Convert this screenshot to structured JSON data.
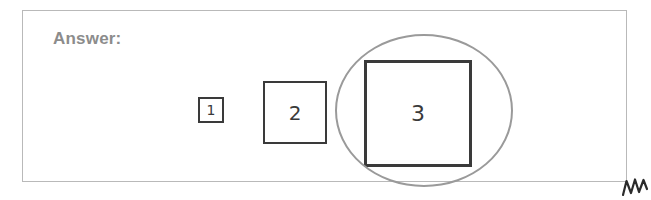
{
  "panel": {
    "label": "Answer:",
    "border_color": "#b9b9b9",
    "background": "#ffffff"
  },
  "label_color": "#8c8c8c",
  "diagram": {
    "type": "nested-squares-size-sequence",
    "stroke_color": "#3a3a3a",
    "highlight_color": "#9a9a9a",
    "shapes": [
      {
        "name": "square-1",
        "label": "1",
        "shape": "square",
        "x": 175,
        "y": 86,
        "width": 26,
        "height": 26,
        "stroke_width": 2,
        "selected": false
      },
      {
        "name": "square-2",
        "label": "2",
        "shape": "square",
        "x": 240,
        "y": 70,
        "width": 64,
        "height": 63,
        "stroke_width": 2.5,
        "selected": false
      },
      {
        "name": "square-3",
        "label": "3",
        "shape": "square",
        "x": 341,
        "y": 49,
        "width": 108,
        "height": 107,
        "stroke_width": 3,
        "selected": true
      }
    ],
    "highlight": {
      "name": "selection-circle",
      "shape": "circle",
      "x": 312,
      "y": 23,
      "width": 178,
      "height": 153,
      "stroke_width": 2.5,
      "encircles": "square-3"
    },
    "annotation": {
      "name": "pen-mark",
      "description": "handwritten-zigzag-mark",
      "x": 622,
      "y": 176
    }
  }
}
